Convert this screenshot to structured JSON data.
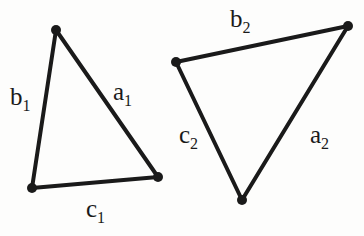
{
  "figure": {
    "type": "geometry-diagram",
    "background_color": "#fdfdfc",
    "stroke_color": "#1a1a1a",
    "text_color": "#1a1a1a",
    "stroke_width": 4,
    "vertex_dot_radius": 5
  },
  "triangles": [
    {
      "id": "triangle-1",
      "name": "left-triangle",
      "vertices": [
        {
          "name": "apex",
          "x": 56,
          "y": 30
        },
        {
          "name": "bottom-right",
          "x": 158,
          "y": 177
        },
        {
          "name": "bottom-left",
          "x": 32,
          "y": 188
        }
      ],
      "sides": [
        {
          "name": "side-a1",
          "label": "a",
          "subscript": "1",
          "from": "apex",
          "to": "bottom-right"
        },
        {
          "name": "side-b1",
          "label": "b",
          "subscript": "1",
          "from": "apex",
          "to": "bottom-left"
        },
        {
          "name": "side-c1",
          "label": "c",
          "subscript": "1",
          "from": "bottom-left",
          "to": "bottom-right"
        }
      ]
    },
    {
      "id": "triangle-2",
      "name": "right-triangle",
      "vertices": [
        {
          "name": "top-left",
          "x": 176,
          "y": 62
        },
        {
          "name": "top-right",
          "x": 348,
          "y": 26
        },
        {
          "name": "bottom",
          "x": 242,
          "y": 200
        }
      ],
      "sides": [
        {
          "name": "side-a2",
          "label": "a",
          "subscript": "2",
          "from": "top-right",
          "to": "bottom"
        },
        {
          "name": "side-b2",
          "label": "b",
          "subscript": "2",
          "from": "top-left",
          "to": "top-right"
        },
        {
          "name": "side-c2",
          "label": "c",
          "subscript": "2",
          "from": "top-left",
          "to": "bottom"
        }
      ]
    }
  ],
  "labels": {
    "a1": {
      "base": "a",
      "sub": "1"
    },
    "b1": {
      "base": "b",
      "sub": "1"
    },
    "c1": {
      "base": "c",
      "sub": "1"
    },
    "a2": {
      "base": "a",
      "sub": "2"
    },
    "b2": {
      "base": "b",
      "sub": "2"
    },
    "c2": {
      "base": "c",
      "sub": "2"
    }
  }
}
